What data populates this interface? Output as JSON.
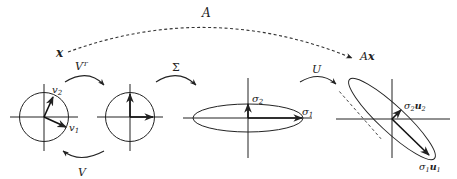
{
  "diagram": {
    "top_arrow": {
      "label": "A",
      "from_label": "x",
      "to_label": "Ax"
    },
    "steps": [
      {
        "label": "Vᵀ",
        "return_label": "V"
      },
      {
        "label": "Σ"
      },
      {
        "label": "U"
      }
    ],
    "panels": [
      {
        "name": "unit-circle",
        "vectors": [
          "v",
          "v"
        ],
        "subs": [
          "2",
          "1"
        ]
      },
      {
        "name": "rotated-circle"
      },
      {
        "name": "scaled-ellipse",
        "vectors": [
          "σ",
          "σ"
        ],
        "subs": [
          "2",
          "1"
        ]
      },
      {
        "name": "rotated-ellipse",
        "labels": {
          "top": {
            "s": "σ",
            "s_sub": "2",
            "u": "u",
            "u_sub": "2"
          },
          "bottom": {
            "s": "σ",
            "s_sub": "1",
            "u": "u",
            "u_sub": "1"
          }
        }
      }
    ],
    "colors": {
      "stroke": "#222222",
      "background": "#ffffff"
    }
  }
}
